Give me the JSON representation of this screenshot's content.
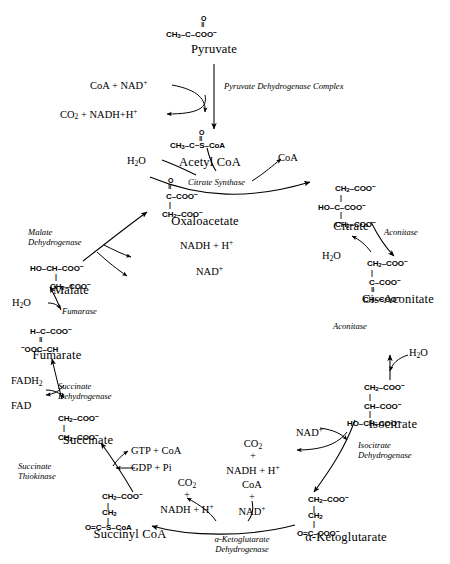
{
  "diagram": {
    "type": "metabolic-pathway"
  },
  "metabolites": {
    "pyruvate": {
      "name": "Pyruvate",
      "formula_lines": [
        "O",
        "||",
        "CH3-C-COO-"
      ]
    },
    "acetyl_coa": {
      "name": "Acetyl CoA",
      "formula_lines": [
        "O",
        "||",
        "CH3-C~S-CoA"
      ]
    },
    "citrate": {
      "name": "Citrate",
      "formula_lines": [
        "CH2-COO-",
        "|",
        "HO-C-COO-",
        "|",
        "CH2-COO-"
      ]
    },
    "cis_aconitate": {
      "name": "Cis-Aconitate",
      "formula_lines": [
        "CH2-COO-",
        "|",
        "C-COO-",
        "||",
        "CH-COO-"
      ]
    },
    "isocitrate": {
      "name": "Isocitrate",
      "formula_lines": [
        "CH2-COO-",
        "|",
        "CH-COO-",
        "|",
        "HO-CH-COO-"
      ]
    },
    "alpha_kg": {
      "name": "α-Ketoglutarate",
      "formula_lines": [
        "CH2-COO-",
        "|",
        "CH2",
        "|",
        "O=C-COO-"
      ]
    },
    "succinyl_coa": {
      "name": "Succinyl CoA",
      "formula_lines": [
        "CH2-COO-",
        "|",
        "CH2",
        "|",
        "O=C~S-CoA"
      ]
    },
    "succinate": {
      "name": "Succinate",
      "formula_lines": [
        "CH2-COO-",
        "|",
        "CH2-COO-"
      ]
    },
    "fumarate": {
      "name": "Fumarate",
      "formula_lines": [
        "H-C-COO-",
        "||",
        "-OOC-CH"
      ]
    },
    "malate": {
      "name": "Malate",
      "formula_lines": [
        "HO-CH-COO-",
        "|",
        "CH2-COO-"
      ]
    },
    "oxaloacetate": {
      "name": "Oxaloacetate",
      "formula_lines": [
        "O",
        "||",
        "C-COO-",
        "|",
        "CH2-COO-"
      ]
    }
  },
  "enzymes": {
    "pdh": {
      "line1": "Pyruvate Dehydrogenase Complex",
      "line2": ""
    },
    "cs": {
      "line1": "Citrate Synthase",
      "line2": ""
    },
    "aco1": {
      "line1": "Aconitase",
      "line2": ""
    },
    "aco2": {
      "line1": "Aconitase",
      "line2": ""
    },
    "idh": {
      "line1": "Isocitrate",
      "line2": "Dehydrogenase"
    },
    "kgdh": {
      "line1": "α-Ketoglutarate",
      "line2": "Dehydrogenase"
    },
    "thiokinase": {
      "line1": "Succinate",
      "line2": "Thiokinase"
    },
    "sdh": {
      "line1": "Succinate",
      "line2": "Dehydrogenase"
    },
    "fumarase": {
      "line1": "Fumarase",
      "line2": ""
    },
    "mdh": {
      "line1": "Malate",
      "line2": "Dehydrogenase"
    }
  },
  "cofactors": {
    "coa_nad_in": "CoA + NAD+",
    "co2_nadh_out": "CO2 + NADH+H+",
    "water_cs": "H2O",
    "coa_cs_out": "CoA",
    "water_aco1": "H2O",
    "water_aco2": "H2O",
    "nad_idh": "NAD+",
    "co2_idh": "CO2",
    "plus_idh": "+",
    "nadh_idh": "NADH + H+",
    "coa_kgdh": "CoA",
    "plus_kgdh_in": "+",
    "nad_kgdh": "NAD+",
    "co2_kgdh": "CO2",
    "plus_kgdh_out": "+",
    "nadh_kgdh": "NADH + H+",
    "gtp_coa": "GTP + CoA",
    "gdp_pi": "GDP + Pi",
    "fadh2": "FADH2",
    "fad": "FAD",
    "water_fumarase": "H2O",
    "nadh_mdh": "NADH + H+",
    "nad_mdh": "NAD+"
  }
}
